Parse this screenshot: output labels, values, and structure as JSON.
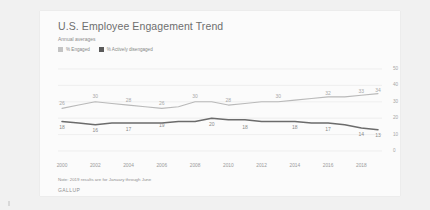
{
  "card": {
    "title": "U.S. Employee Engagement Trend",
    "subtitle": "Annual averages",
    "note": "Note: 2019 results are for January through June",
    "brand": "GALLUP"
  },
  "legend": {
    "items": [
      {
        "label": "% Engaged",
        "color": "#c3c3c3",
        "swatch": "engaged"
      },
      {
        "label": "% Actively disengaged",
        "color": "#5a5a5a",
        "swatch": "disengaged"
      }
    ]
  },
  "colors": {
    "engaged_line": "#b9b9b9",
    "disengaged_line": "#6b6b6b",
    "gridline": "#e6e6e6",
    "axis_text": "#9a9a9a",
    "card_background": "#fbfbfb",
    "page_background": "#f1f1f1"
  },
  "chart_data": {
    "type": "line",
    "title": "U.S. Employee Engagement Trend",
    "subtitle": "Annual averages",
    "xlabel": "",
    "ylabel": "",
    "ylim": [
      0,
      50
    ],
    "yticks": [
      50,
      40,
      30,
      20,
      10,
      0
    ],
    "grid": true,
    "legend_position": "top-left",
    "x": [
      2000,
      2001,
      2002,
      2003,
      2004,
      2005,
      2006,
      2007,
      2008,
      2009,
      2010,
      2011,
      2012,
      2013,
      2014,
      2015,
      2016,
      2017,
      2018,
      2019
    ],
    "xtick_labels": [
      "2000",
      "2002",
      "2004",
      "2006",
      "2008",
      "2010",
      "2012",
      "2014",
      "2016",
      "2018"
    ],
    "xticks": [
      2000,
      2002,
      2004,
      2006,
      2008,
      2010,
      2012,
      2014,
      2016,
      2018
    ],
    "series": [
      {
        "name": "% Engaged",
        "color": "#b9b9b9",
        "values": [
          26,
          28,
          30,
          29,
          28,
          27,
          26,
          27,
          30,
          30,
          28,
          29,
          30,
          30,
          31,
          32,
          33,
          33,
          34,
          35
        ],
        "labeled_points": [
          {
            "x": 2000,
            "value": 26
          },
          {
            "x": 2002,
            "value": 30
          },
          {
            "x": 2004,
            "value": 28
          },
          {
            "x": 2006,
            "value": 26
          },
          {
            "x": 2008,
            "value": 30
          },
          {
            "x": 2010,
            "value": 28
          },
          {
            "x": 2013,
            "value": 30
          },
          {
            "x": 2016,
            "value": 32
          },
          {
            "x": 2018,
            "value": 33
          },
          {
            "x": 2019,
            "value": 34
          }
        ]
      },
      {
        "name": "% Actively disengaged",
        "color": "#6b6b6b",
        "values": [
          18,
          17,
          16,
          17,
          17,
          17,
          17,
          18,
          18,
          20,
          19,
          19,
          18,
          18,
          18,
          17,
          17,
          16,
          14,
          13
        ],
        "labeled_points": [
          {
            "x": 2000,
            "value": 18
          },
          {
            "x": 2002,
            "value": 16
          },
          {
            "x": 2004,
            "value": 17
          },
          {
            "x": 2006,
            "value": 19
          },
          {
            "x": 2009,
            "value": 20
          },
          {
            "x": 2011,
            "value": 18
          },
          {
            "x": 2014,
            "value": 18
          },
          {
            "x": 2016,
            "value": 17
          },
          {
            "x": 2018,
            "value": 14
          },
          {
            "x": 2019,
            "value": 13
          }
        ]
      }
    ]
  }
}
